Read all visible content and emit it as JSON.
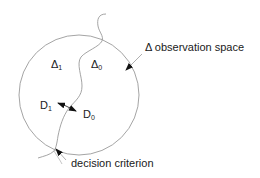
{
  "diagram": {
    "regions": [
      {
        "id": "delta1",
        "symbol": "Δ",
        "subscript": "1"
      },
      {
        "id": "delta0",
        "symbol": "Δ",
        "subscript": "0"
      }
    ],
    "decisions": [
      {
        "id": "d1",
        "symbol": "D",
        "subscript": "1"
      },
      {
        "id": "d0",
        "symbol": "D",
        "subscript": "0"
      }
    ],
    "annotations": {
      "observation_space": "Δ observation space",
      "decision_criterion": "decision criterion"
    },
    "colors": {
      "line": "#9a9a9a",
      "arrow": "#111111",
      "text": "#1a1a1a"
    }
  }
}
